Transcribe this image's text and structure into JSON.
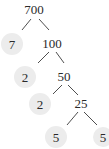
{
  "diagram": {
    "type": "factor-tree",
    "root": "700",
    "nodes": [
      {
        "id": "n700",
        "label": "700",
        "x": 34,
        "y": 14,
        "leaf": false
      },
      {
        "id": "n7",
        "label": "7",
        "x": 12,
        "y": 47,
        "leaf": true
      },
      {
        "id": "n100",
        "label": "100",
        "x": 52,
        "y": 47,
        "leaf": false
      },
      {
        "id": "n2a",
        "label": "2",
        "x": 25,
        "y": 80,
        "leaf": true
      },
      {
        "id": "n50",
        "label": "50",
        "x": 64,
        "y": 80,
        "leaf": false
      },
      {
        "id": "n2b",
        "label": "2",
        "x": 40,
        "y": 107,
        "leaf": true
      },
      {
        "id": "n25",
        "label": "25",
        "x": 80,
        "y": 107,
        "leaf": false
      },
      {
        "id": "n5a",
        "label": "5",
        "x": 56,
        "y": 140,
        "leaf": true
      },
      {
        "id": "n5b",
        "label": "5",
        "x": 103,
        "y": 140,
        "leaf": true
      }
    ],
    "edges": [
      [
        "n700",
        "n7"
      ],
      [
        "n700",
        "n100"
      ],
      [
        "n100",
        "n2a"
      ],
      [
        "n100",
        "n50"
      ],
      [
        "n50",
        "n2b"
      ],
      [
        "n50",
        "n25"
      ],
      [
        "n25",
        "n5a"
      ],
      [
        "n25",
        "n5b"
      ]
    ],
    "leaf_highlight_color": "#ececec"
  }
}
